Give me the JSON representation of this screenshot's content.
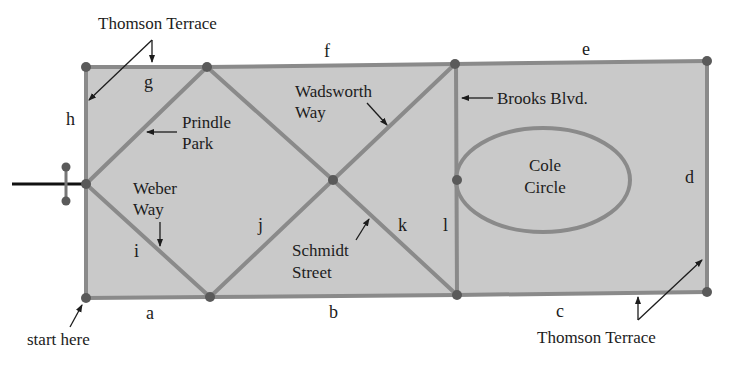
{
  "diagram": {
    "type": "street-map-graph",
    "colors": {
      "block_fill": "#c9c9c9",
      "street": "#8a8a8a",
      "node": "#5a5a5a",
      "entry_road": "#111111",
      "text": "#1c1c1c"
    },
    "edges": {
      "a": "a",
      "b": "b",
      "c": "c",
      "d": "d",
      "e": "e",
      "f": "f",
      "g": "g",
      "h": "h",
      "i": "i",
      "j": "j",
      "k": "k",
      "l": "l"
    },
    "streets": {
      "thomson_top": "Thomson Terrace",
      "thomson_bottom": "Thomson Terrace",
      "prindle": [
        "Prindle",
        "Park"
      ],
      "weber": [
        "Weber",
        "Way"
      ],
      "wadsworth": [
        "Wadsworth",
        "Way"
      ],
      "schmidt": [
        "Schmidt",
        "Street"
      ],
      "brooks": "Brooks Blvd.",
      "cole": [
        "Cole",
        "Circle"
      ]
    },
    "start_label": "start here"
  }
}
